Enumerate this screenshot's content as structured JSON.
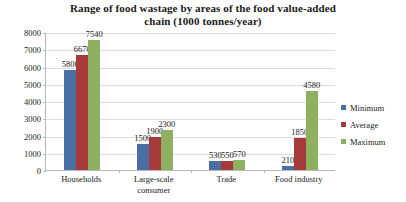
{
  "chart_data": {
    "type": "bar",
    "title": "Range of food wastage by areas of the food value-added chain (1000 tonnes/year)",
    "title_line1": "Range of food wastage by areas of the food value-added",
    "title_line2": "chain (1000 tonnes/year)",
    "xlabel": "",
    "ylabel": "",
    "ylim": [
      0,
      8000
    ],
    "ytick_step": 1000,
    "grid": true,
    "legend_position": "right",
    "categories": [
      "Households",
      "Large-scale consumer",
      "Trade",
      "Food industry"
    ],
    "category_lines": [
      [
        "Households"
      ],
      [
        "Large-scale",
        "consumer"
      ],
      [
        "Trade"
      ],
      [
        "Food industry"
      ]
    ],
    "yticks": [
      "0",
      "1000",
      "2000",
      "3000",
      "4000",
      "5000",
      "6000",
      "7000",
      "8000"
    ],
    "ytick_values": [
      0,
      1000,
      2000,
      3000,
      4000,
      5000,
      6000,
      7000,
      8000
    ],
    "series": [
      {
        "name": "Minimum",
        "color": "#4a6fa5",
        "values": [
          5800,
          1500,
          530,
          210
        ]
      },
      {
        "name": "Average",
        "color": "#a6393a",
        "values": [
          6670,
          1900,
          550,
          1850
        ]
      },
      {
        "name": "Maximum",
        "color": "#8fb061",
        "values": [
          7540,
          2300,
          570,
          4580
        ]
      }
    ],
    "data_labels": [
      [
        "5800",
        "6670",
        "7540"
      ],
      [
        "1500",
        "1900",
        "2300"
      ],
      [
        "530",
        "550",
        "570"
      ],
      [
        "210",
        "1850",
        "4580"
      ]
    ]
  },
  "legend": {
    "items": [
      {
        "label": "Minimum",
        "color": "#4a6fa5"
      },
      {
        "label": "Average",
        "color": "#a6393a"
      },
      {
        "label": "Maximum",
        "color": "#8fb061"
      }
    ]
  }
}
